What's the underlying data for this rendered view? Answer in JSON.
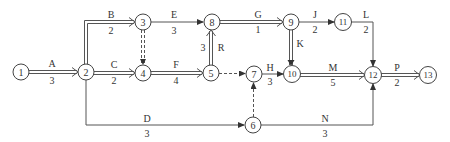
{
  "diagram": {
    "type": "network-schedule",
    "nodes": [
      {
        "id": "1",
        "label": "1",
        "x": 21,
        "y": 72
      },
      {
        "id": "2",
        "label": "2",
        "x": 86,
        "y": 72
      },
      {
        "id": "3",
        "label": "3",
        "x": 143,
        "y": 22
      },
      {
        "id": "4",
        "label": "4",
        "x": 143,
        "y": 73
      },
      {
        "id": "5",
        "label": "5",
        "x": 211,
        "y": 73
      },
      {
        "id": "6",
        "label": "6",
        "x": 253,
        "y": 125
      },
      {
        "id": "7",
        "label": "7",
        "x": 254,
        "y": 74
      },
      {
        "id": "8",
        "label": "8",
        "x": 212,
        "y": 22
      },
      {
        "id": "9",
        "label": "9",
        "x": 291,
        "y": 22
      },
      {
        "id": "10",
        "label": "10",
        "x": 292,
        "y": 74
      },
      {
        "id": "11",
        "label": "11",
        "x": 343,
        "y": 22
      },
      {
        "id": "12",
        "label": "12",
        "x": 373,
        "y": 75
      },
      {
        "id": "13",
        "label": "13",
        "x": 428,
        "y": 75
      }
    ],
    "activities": [
      {
        "name": "A",
        "duration": "3",
        "from": "1",
        "to": "2",
        "critical": true
      },
      {
        "name": "B",
        "duration": "2",
        "from": "2",
        "to": "3",
        "critical": true
      },
      {
        "name": "C",
        "duration": "2",
        "from": "2",
        "to": "4",
        "critical": true
      },
      {
        "name": "D",
        "duration": "3",
        "from": "2",
        "to": "6",
        "critical": false
      },
      {
        "name": "E",
        "duration": "3",
        "from": "3",
        "to": "8",
        "critical": false
      },
      {
        "name": "F",
        "duration": "4",
        "from": "4",
        "to": "5",
        "critical": true
      },
      {
        "name": "G",
        "duration": "1",
        "from": "8",
        "to": "9",
        "critical": true
      },
      {
        "name": "H",
        "duration": "3",
        "from": "7",
        "to": "10",
        "critical": false
      },
      {
        "name": "J",
        "duration": "2",
        "from": "9",
        "to": "11",
        "critical": false
      },
      {
        "name": "K",
        "duration": "",
        "from": "9",
        "to": "10",
        "critical": true
      },
      {
        "name": "L",
        "duration": "2",
        "from": "11",
        "to": "12",
        "critical": false
      },
      {
        "name": "M",
        "duration": "5",
        "from": "10",
        "to": "12",
        "critical": true
      },
      {
        "name": "N",
        "duration": "3",
        "from": "6",
        "to": "12",
        "critical": false
      },
      {
        "name": "P",
        "duration": "2",
        "from": "12",
        "to": "13",
        "critical": true
      },
      {
        "name": "R",
        "duration": "3",
        "from": "5",
        "to": "8",
        "critical": true
      }
    ],
    "dummies": [
      {
        "from": "3",
        "to": "4",
        "critical": true
      },
      {
        "from": "5",
        "to": "7",
        "critical": false
      },
      {
        "from": "6",
        "to": "7",
        "critical": false
      }
    ]
  }
}
